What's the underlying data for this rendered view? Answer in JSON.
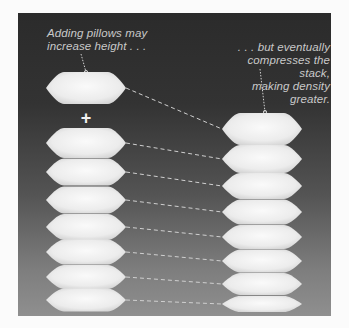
{
  "diagram": {
    "caption_left": {
      "line1": "Adding pillows may",
      "line2": "increase height . . ."
    },
    "caption_right": {
      "line1": ". . . but eventually",
      "line2": "compresses the stack,",
      "line3": "making density greater."
    },
    "plus_symbol": "+",
    "left_stack": {
      "added_pillow": {
        "cx": 86,
        "cy": 88,
        "w": 80,
        "h": 32
      },
      "pillows": [
        {
          "cx": 86,
          "cy": 143,
          "w": 80,
          "h": 30
        },
        {
          "cx": 86,
          "cy": 172,
          "w": 80,
          "h": 27
        },
        {
          "cx": 86,
          "cy": 200,
          "w": 80,
          "h": 27
        },
        {
          "cx": 86,
          "cy": 227,
          "w": 80,
          "h": 26
        },
        {
          "cx": 86,
          "cy": 252,
          "w": 80,
          "h": 25
        },
        {
          "cx": 86,
          "cy": 277,
          "w": 80,
          "h": 24
        },
        {
          "cx": 86,
          "cy": 300,
          "w": 80,
          "h": 23
        }
      ]
    },
    "right_stack": {
      "pillows": [
        {
          "cx": 262,
          "cy": 129,
          "w": 80,
          "h": 32
        },
        {
          "cx": 262,
          "cy": 159,
          "w": 80,
          "h": 28
        },
        {
          "cx": 262,
          "cy": 186,
          "w": 80,
          "h": 26
        },
        {
          "cx": 262,
          "cy": 212,
          "w": 80,
          "h": 25
        },
        {
          "cx": 262,
          "cy": 237,
          "w": 80,
          "h": 24
        },
        {
          "cx": 262,
          "cy": 261,
          "w": 80,
          "h": 23
        },
        {
          "cx": 262,
          "cy": 284,
          "w": 80,
          "h": 22
        },
        {
          "cx": 262,
          "cy": 304,
          "w": 80,
          "h": 16
        }
      ]
    },
    "colors": {
      "pillow_fill": "#f2f2f2",
      "pillow_shade": "#d8d8d8",
      "connector": "#d0d0d0",
      "caption_text": "#c9c9c9",
      "panel_top": "#2b2b2b",
      "panel_bottom": "#8f8f8f"
    }
  }
}
